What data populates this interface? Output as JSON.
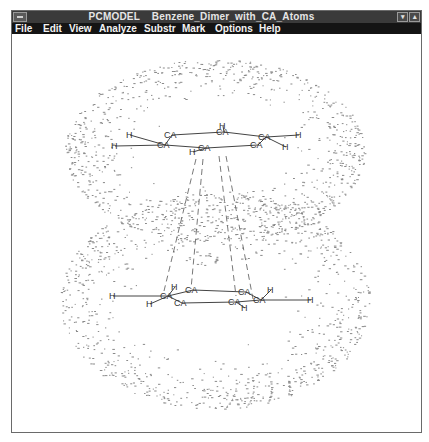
{
  "window": {
    "app_name": "PCMODEL",
    "document_title": "Benzene_Dimer_with_CA_Atoms",
    "title_full": "PCMODEL    Benzene_Dimer_with_CA_Atoms",
    "buttons": {
      "minimize_glyph": "▾",
      "maximize_glyph": "▴"
    }
  },
  "menubar": {
    "items": [
      {
        "label": "File",
        "mnemonic": "F"
      },
      {
        "label": "Edit",
        "mnemonic": "E"
      },
      {
        "label": "View",
        "mnemonic": "V"
      },
      {
        "label": "Analyze",
        "mnemonic": ""
      },
      {
        "label": "Substr",
        "mnemonic": "S"
      },
      {
        "label": "Mark",
        "mnemonic": ""
      },
      {
        "label": "Options",
        "mnemonic": ""
      },
      {
        "label": "Help",
        "mnemonic": "H"
      }
    ]
  },
  "molecule": {
    "name": "Benzene dimer",
    "top_ring": {
      "carbons": [
        {
          "label": "CA",
          "x": 163,
          "y": 137
        },
        {
          "label": "CA",
          "x": 156,
          "y": 147
        },
        {
          "label": "CA",
          "x": 215,
          "y": 134
        },
        {
          "label": "CA",
          "x": 197,
          "y": 150
        },
        {
          "label": "CA",
          "x": 257,
          "y": 139
        },
        {
          "label": "CA",
          "x": 249,
          "y": 147
        }
      ],
      "hydrogens": [
        {
          "label": "H",
          "x": 125,
          "y": 137
        },
        {
          "label": "H",
          "x": 110,
          "y": 148
        },
        {
          "label": "H",
          "x": 218,
          "y": 128
        },
        {
          "label": "H",
          "x": 188,
          "y": 154
        },
        {
          "label": "H",
          "x": 294,
          "y": 137
        },
        {
          "label": "H",
          "x": 281,
          "y": 149
        }
      ]
    },
    "bottom_ring": {
      "carbons": [
        {
          "label": "CA",
          "x": 159,
          "y": 298
        },
        {
          "label": "CA",
          "x": 173,
          "y": 305
        },
        {
          "label": "CA",
          "x": 184,
          "y": 292
        },
        {
          "label": "CA",
          "x": 227,
          "y": 304
        },
        {
          "label": "CA",
          "x": 237,
          "y": 294
        },
        {
          "label": "CA",
          "x": 252,
          "y": 302
        }
      ],
      "hydrogens": [
        {
          "label": "H",
          "x": 108,
          "y": 298
        },
        {
          "label": "H",
          "x": 145,
          "y": 306
        },
        {
          "label": "H",
          "x": 170,
          "y": 289
        },
        {
          "label": "H",
          "x": 240,
          "y": 310
        },
        {
          "label": "H",
          "x": 266,
          "y": 292
        },
        {
          "label": "H",
          "x": 306,
          "y": 302
        }
      ]
    },
    "interaction_lines": 4
  },
  "colors": {
    "titlebar": "#3a3a3a",
    "menubar": "#141414",
    "menu_text": "#f2f2f2",
    "canvas": "#ffffff",
    "ink": "#333333",
    "dots": "#8a8a8a"
  }
}
